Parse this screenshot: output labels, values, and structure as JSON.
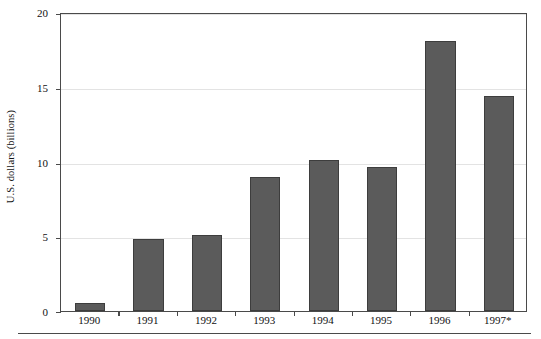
{
  "chart_data": {
    "type": "bar",
    "title": "",
    "subtitle": "",
    "xlabel": "",
    "ylabel": "U.S. dollars (billions)",
    "categories": [
      "1990",
      "1991",
      "1992",
      "1993",
      "1994",
      "1995",
      "1996",
      "1997*"
    ],
    "values": [
      0.55,
      4.8,
      5.1,
      8.95,
      10.1,
      9.6,
      18.05,
      14.35
    ],
    "series": [
      {
        "name": "U.S. dollars (billions)",
        "values": [
          0.55,
          4.8,
          5.1,
          8.95,
          10.1,
          9.6,
          18.05,
          14.35
        ]
      }
    ],
    "ylim": [
      0,
      20
    ],
    "xlim": [
      0,
      8
    ],
    "y_ticks": [
      0,
      5,
      10,
      15,
      20
    ],
    "y_tick_labels": [
      "0",
      "5",
      "10",
      "15",
      "20"
    ],
    "grid": "horizontal",
    "legend": "none",
    "annotations": [
      "* denotes estimated or preliminary value for 1997"
    ],
    "colors": {
      "bar_fill": "#5b5b5b",
      "bar_edge": "#3d3d3d",
      "gridline": "#e3e3e3",
      "axis": "#4a4a4a",
      "text": "#111111",
      "background": "#ffffff"
    }
  }
}
